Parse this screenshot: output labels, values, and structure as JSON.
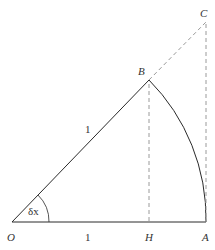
{
  "diagram": {
    "type": "geometry-unit-circle-sector",
    "colors": {
      "solid": "#2a2a2a",
      "dashed": "#9a9a9a",
      "label": "#333333"
    },
    "points": {
      "O": {
        "label": "O",
        "x": 12,
        "y": 222
      },
      "H": {
        "label": "H",
        "x": 149,
        "y": 222
      },
      "A": {
        "label": "A",
        "x": 206,
        "y": 222
      },
      "B": {
        "label": "B",
        "x": 149,
        "y": 80
      },
      "C": {
        "label": "C",
        "x": 206,
        "y": 22
      }
    },
    "labels": {
      "radius_OB": "1",
      "base_OA": "1",
      "angle": "δx"
    },
    "segments": [
      {
        "from": "O",
        "to": "B",
        "style": "solid"
      },
      {
        "from": "O",
        "to": "A",
        "style": "solid"
      },
      {
        "from": "B",
        "to": "C",
        "style": "dashed"
      },
      {
        "from": "B",
        "to": "H",
        "style": "dashed"
      },
      {
        "from": "C",
        "to": "A",
        "style": "dashed"
      },
      {
        "arc": "B-A",
        "center": "O",
        "radius": 1,
        "style": "solid"
      }
    ]
  }
}
